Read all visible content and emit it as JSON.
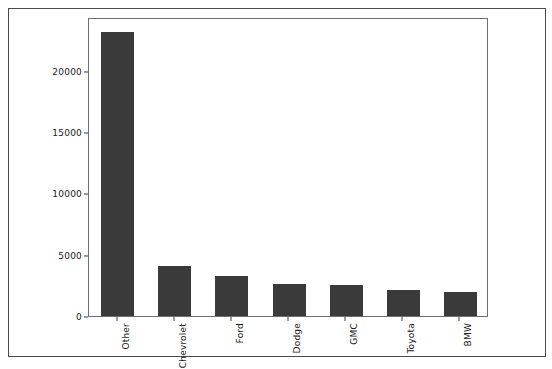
{
  "chart_data": {
    "type": "bar",
    "title": "",
    "subtitle": "",
    "xlabel": "",
    "ylabel": "",
    "categories": [
      "Other",
      "Chevrolet",
      "Ford",
      "Dodge",
      "GMC",
      "Toyota",
      "BMW"
    ],
    "values": [
      23200,
      4050,
      3300,
      2600,
      2500,
      2100,
      1950
    ],
    "series": [
      {
        "name": "count",
        "values": [
          23200,
          4050,
          3300,
          2600,
          2500,
          2100,
          1950
        ]
      }
    ],
    "ylim": [
      0,
      24400
    ],
    "xlim": [
      0,
      7
    ],
    "ytick_labels": [
      "0",
      "5000",
      "10000",
      "15000",
      "20000"
    ],
    "ytick_values": [
      0,
      5000,
      10000,
      15000,
      20000
    ],
    "grid": false,
    "legend": null,
    "legend_position": "none",
    "bar_color": "#3a3a3a",
    "background_color": "#ffffff",
    "axis_color": "#6e6e76",
    "frame_color": "#4a4a52",
    "xtick_rotation": -90
  }
}
